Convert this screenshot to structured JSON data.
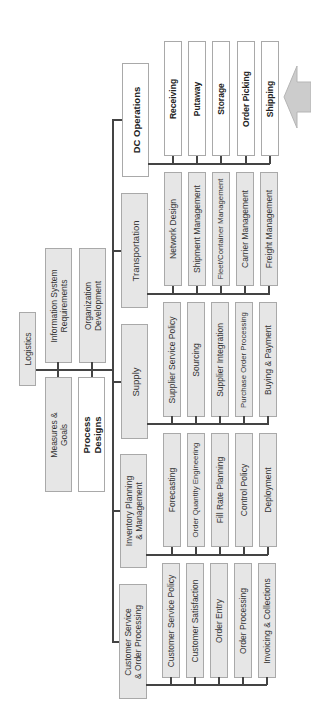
{
  "root": {
    "label": "Logistics"
  },
  "supporting": [
    {
      "label": "Information System\nRequirements",
      "style": "gray"
    },
    {
      "label": "Organization\nDevelopment",
      "style": "gray"
    },
    {
      "label": "Measures &\nGoals",
      "style": "gray"
    },
    {
      "label": "Process\nDesigns",
      "style": "white-bold"
    }
  ],
  "functions": [
    {
      "label": "DC Operations",
      "style": "white-bold",
      "activities": [
        "Receiving",
        "Putaway",
        "Storage",
        "Order Picking",
        "Shipping"
      ]
    },
    {
      "label": "Transportation",
      "style": "gray",
      "activities": [
        "Network Design",
        "Shipment Management",
        "Fleet/Container Management",
        "Carrier Management",
        "Freight Management"
      ]
    },
    {
      "label": "Supply",
      "style": "gray",
      "activities": [
        "Supplier Service Policy",
        "Sourcing",
        "Supplier Integration",
        "Purchase Order Processing",
        "Buying & Payment"
      ]
    },
    {
      "label": "Inventory Planning\n& Management",
      "style": "gray",
      "activities": [
        "Forecasting",
        "Order Quantity Engineering",
        "Fill Rate Planning",
        "Control Policy",
        "Deployment"
      ]
    },
    {
      "label": "Customer Service\n& Order Processing",
      "style": "gray",
      "activities": [
        "Customer Service Policy",
        "Customer Satisfaction",
        "Order Entry",
        "Order Processing",
        "Invoicing & Collections"
      ]
    }
  ],
  "highlight_arrow": {
    "points_to": "DC Operations",
    "color": "#cccccc"
  },
  "colors": {
    "box_fill": "#e6e6e6",
    "box_border": "#a9a9a9",
    "line": "#444444"
  }
}
